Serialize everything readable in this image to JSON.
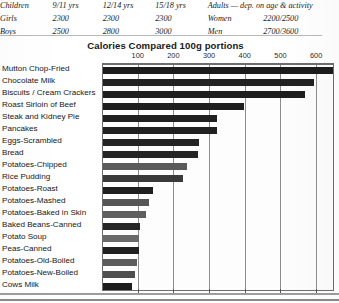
{
  "top_table": {
    "rows": [
      {
        "label": "Children",
        "a": "9/11 yrs",
        "b": "12/14 yrs",
        "c": "15/18 yrs",
        "d": "Adults — dep. on age & activity",
        "e": ""
      },
      {
        "label": "Girls",
        "a": "2300",
        "b": "2300",
        "c": "2300",
        "d": "Women",
        "e": "2200/2500"
      },
      {
        "label": "Boys",
        "a": "2500",
        "b": "2800",
        "c": "3000",
        "d": "Men",
        "e": "2700/3600"
      }
    ]
  },
  "chart_data": {
    "type": "bar",
    "orientation": "horizontal",
    "title": "Calories Compared 100g portions",
    "xlabel": "",
    "ylabel": "",
    "xlim": [
      0,
      650
    ],
    "ticks": [
      100,
      200,
      300,
      400,
      500,
      600
    ],
    "grid": true,
    "legend": "none",
    "categories": [
      "Mutton Chop-Fried",
      "Chocolate Milk",
      "Biscuits / Cream Crackers",
      "Roast Sirloin of Beef",
      "Steak and Kidney Pie",
      "Pancakes",
      "Eggs-Scrambled",
      "Bread",
      "Potatoes-Chipped",
      "Rice Pudding",
      "Potatoes-Roast",
      "Potatoes-Mashed",
      "Potatoes-Baked in Skin",
      "Baked Beans-Canned",
      "Potato Soup",
      "Peas-Canned",
      "Potatoes-Old-Boiled",
      "Potatoes-New-Boiled",
      "Cows Milk"
    ],
    "values": [
      645,
      590,
      565,
      395,
      320,
      320,
      270,
      265,
      235,
      225,
      140,
      130,
      120,
      105,
      100,
      100,
      95,
      90,
      80
    ],
    "bar_colors": [
      "#1c1c1c",
      "#222222",
      "#1e1e1e",
      "#1f1f1f",
      "#202020",
      "#212121",
      "#232323",
      "#242424",
      "#5a5a5a",
      "#3a3a3a",
      "#1f1f1f",
      "#565656",
      "#5e5e5e",
      "#262626",
      "#6a6a6a",
      "#202020",
      "#5c5c5c",
      "#4e4e4e",
      "#1d1d1d"
    ]
  }
}
